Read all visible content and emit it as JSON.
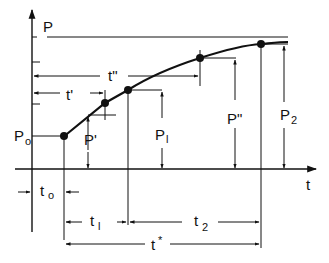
{
  "diagram": {
    "type": "growth-curve-timing",
    "axes": {
      "y_label": "P",
      "x_label": "t"
    },
    "asymptote_label": "P",
    "points": [
      {
        "name": "P0",
        "label": "P",
        "sub": "o"
      },
      {
        "name": "P'",
        "label": "P'",
        "sub": ""
      },
      {
        "name": "P1",
        "label": "P",
        "sub": "l"
      },
      {
        "name": "P''",
        "label": "P\"",
        "sub": ""
      },
      {
        "name": "P2",
        "label": "P",
        "sub": "2"
      }
    ],
    "intervals": [
      {
        "name": "t'",
        "label": "t'"
      },
      {
        "name": "t''",
        "label": "t\""
      },
      {
        "name": "t0",
        "label": "t",
        "sub": "o"
      },
      {
        "name": "t1",
        "label": "t",
        "sub": "l"
      },
      {
        "name": "t2",
        "label": "t",
        "sub": "2"
      },
      {
        "name": "t*",
        "label": "t",
        "sup": "*"
      }
    ]
  }
}
